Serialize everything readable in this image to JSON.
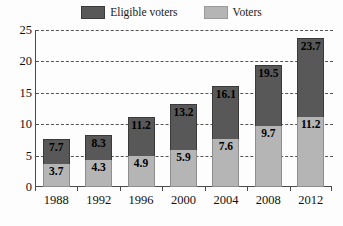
{
  "chart_data": {
    "type": "bar",
    "subtype": "stacked-bar",
    "title": "",
    "subtitle": "",
    "xlabel": "",
    "ylabel": "",
    "categories": [
      "1988",
      "1992",
      "1996",
      "2000",
      "2004",
      "2008",
      "2012"
    ],
    "series": [
      {
        "name": "Eligible voters",
        "color": "#585858",
        "values": [
          7.7,
          8.3,
          11.2,
          13.2,
          16.1,
          19.5,
          23.7
        ],
        "note": "cumulative top of each stacked bar (total eligible voters, millions)"
      },
      {
        "name": "Voters",
        "color": "#b5b5b5",
        "values": [
          3.7,
          4.3,
          4.9,
          5.9,
          7.6,
          9.7,
          11.2
        ],
        "note": "lower light-gray segment of each stacked bar (actual voters, millions)"
      }
    ],
    "ylim": [
      0,
      25
    ],
    "yticks": [
      0,
      5,
      10,
      15,
      20,
      25
    ],
    "ytick_labels": [
      "0",
      "5",
      "10",
      "15",
      "20",
      "25"
    ],
    "grid": true,
    "grid_style": "dashed",
    "grid_axis": "y",
    "legend_position": "top-center"
  },
  "legend": {
    "entries": [
      {
        "label": "Eligible voters",
        "color": "#585858",
        "swatch": "legend-swatch-eligible"
      },
      {
        "label": "Voters",
        "color": "#b5b5b5",
        "swatch": "legend-swatch-voters"
      }
    ]
  },
  "yaxis": {
    "ticks": [
      "25",
      "20",
      "15",
      "10",
      "5",
      "0"
    ]
  },
  "xaxis": {
    "labels": [
      "1988",
      "1992",
      "1996",
      "2000",
      "2004",
      "2008",
      "2012"
    ]
  },
  "bars": [
    {
      "year": "1988",
      "eligible": "7.7",
      "voters": "3.7"
    },
    {
      "year": "1992",
      "eligible": "8.3",
      "voters": "4.3"
    },
    {
      "year": "1996",
      "eligible": "11.2",
      "voters": "4.9"
    },
    {
      "year": "2000",
      "eligible": "13.2",
      "voters": "5.9"
    },
    {
      "year": "2004",
      "eligible": "16.1",
      "voters": "7.6"
    },
    {
      "year": "2008",
      "eligible": "19.5",
      "voters": "9.7"
    },
    {
      "year": "2012",
      "eligible": "23.7",
      "voters": "11.2"
    }
  ],
  "colors": {
    "eligible": "#585858",
    "voters": "#b5b5b5",
    "axis": "#4a4a4a",
    "grid": "#555555",
    "background": "#fdfdfd",
    "text": "#111111"
  }
}
